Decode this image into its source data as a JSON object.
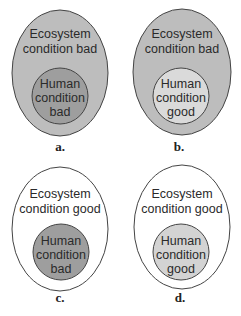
{
  "diagram": {
    "type": "nested-ellipse-comparison",
    "colors": {
      "outer_bad": "#bdbdbd",
      "outer_good": "#ffffff",
      "inner_bad": "#9e9e9e",
      "inner_good_on_bad": "#dadada",
      "inner_good_on_good": "#d3d3d3",
      "stroke": "#444444"
    },
    "panels": [
      {
        "id": "a",
        "label": "a.",
        "outer": {
          "line1": "Ecosystem",
          "line2": "condition bad",
          "state": "bad"
        },
        "inner": {
          "line1": "Human",
          "line2": "condition",
          "line3": "bad",
          "state": "bad"
        }
      },
      {
        "id": "b",
        "label": "b.",
        "outer": {
          "line1": "Ecosystem",
          "line2": "condition bad",
          "state": "bad"
        },
        "inner": {
          "line1": "Human",
          "line2": "condition",
          "line3": "good",
          "state": "good"
        }
      },
      {
        "id": "c",
        "label": "c.",
        "outer": {
          "line1": "Ecosystem",
          "line2": "condition good",
          "state": "good"
        },
        "inner": {
          "line1": "Human",
          "line2": "condition",
          "line3": "bad",
          "state": "bad"
        }
      },
      {
        "id": "d",
        "label": "d.",
        "outer": {
          "line1": "Ecosystem",
          "line2": "condition good",
          "state": "good"
        },
        "inner": {
          "line1": "Human",
          "line2": "condition",
          "line3": "good",
          "state": "good"
        }
      }
    ]
  }
}
